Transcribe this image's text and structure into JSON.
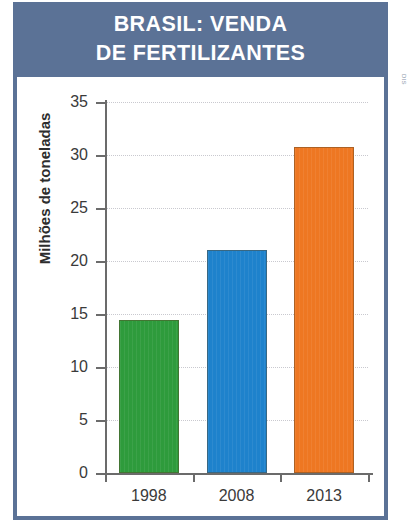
{
  "header": {
    "title_line_1": "BRASIL: VENDA",
    "title_line_2": "DE FERTILIZANTES",
    "background_color": "#5b7296",
    "text_color": "#ffffff"
  },
  "credit": {
    "text": "DIS"
  },
  "chart_data": {
    "type": "bar",
    "title": "BRASIL: VENDA DE FERTILIZANTES",
    "xlabel": "",
    "ylabel": "Milhões de toneladas",
    "categories": [
      "1998",
      "2008",
      "2013"
    ],
    "values": [
      14.4,
      21.0,
      30.8
    ],
    "bar_colors": [
      "#2e9b3c",
      "#1e82cc",
      "#ee7722"
    ],
    "ylim": [
      0,
      35
    ],
    "ytick_labels": [
      "0",
      "5",
      "10",
      "15",
      "20",
      "25",
      "30",
      "35"
    ],
    "ytick_values": [
      0,
      5,
      10,
      15,
      20,
      25,
      30,
      35
    ],
    "grid": true,
    "grid_style": "dotted",
    "grid_color": "#c9c9cf",
    "legend": false,
    "series": [
      {
        "name": "Venda de fertilizantes",
        "values": [
          14.4,
          21.0,
          30.8
        ]
      }
    ]
  }
}
